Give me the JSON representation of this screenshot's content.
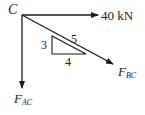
{
  "diagram": {
    "type": "free-body-diagram",
    "point": {
      "label": "C"
    },
    "forces": [
      {
        "id": "applied",
        "label": "40 kN",
        "direction": "right"
      },
      {
        "id": "fbc",
        "label_main": "F",
        "label_sub": "BC",
        "direction": "down-right",
        "slope_ratio": "3:4"
      },
      {
        "id": "fac",
        "label_main": "F",
        "label_sub": "AC",
        "direction": "down"
      }
    ],
    "slope_triangle": {
      "rise": "3",
      "run": "4",
      "hypotenuse": "5"
    },
    "colors": {
      "line": "#1a1a1a",
      "background": "#ffffff"
    }
  }
}
